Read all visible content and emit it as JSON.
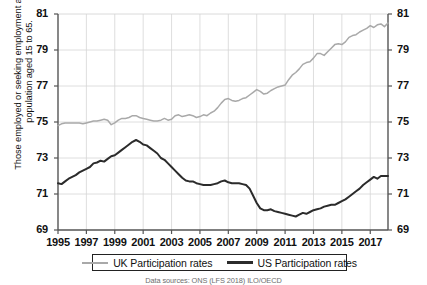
{
  "axis": {
    "y_title": "Those employed or seeking employment as % of population aged 15 to 65.",
    "y_ticks": [
      "69",
      "71",
      "73",
      "75",
      "77",
      "79",
      "81"
    ],
    "x_ticks": [
      "1995",
      "1997",
      "1999",
      "2001",
      "2003",
      "2005",
      "2007",
      "2009",
      "2011",
      "2013",
      "2015",
      "2017"
    ]
  },
  "legend": {
    "uk_label": "UK Participation rates",
    "us_label": "US Participation rates"
  },
  "source": {
    "text": "Data sources: ONS (LFS 2018) ILO/OECD"
  },
  "colors": {
    "uk_line": "#a9a9a9",
    "us_line": "#2b2b2b",
    "gridline": "#d6d6d6",
    "axis": "#555555",
    "background": "#ffffff"
  },
  "chart_data": {
    "type": "line",
    "title": "",
    "xlabel": "",
    "ylabel": "Those employed or seeking employment as % of population aged 15 to 65.",
    "xlim": [
      1995,
      2018.25
    ],
    "ylim": [
      69,
      81
    ],
    "ytick_values": [
      69,
      71,
      73,
      75,
      77,
      79,
      81
    ],
    "xtick_values": [
      1995,
      1997,
      1999,
      2001,
      2003,
      2005,
      2007,
      2009,
      2011,
      2013,
      2015,
      2017
    ],
    "grid": true,
    "legend_position": "bottom",
    "dual_y_axis": true,
    "series": [
      {
        "name": "UK Participation rates",
        "color": "#a9a9a9",
        "x": [
          1995.0,
          1995.25,
          1995.5,
          1995.75,
          1996.0,
          1996.25,
          1996.5,
          1996.75,
          1997.0,
          1997.25,
          1997.5,
          1997.75,
          1998.0,
          1998.25,
          1998.5,
          1998.75,
          1999.0,
          1999.25,
          1999.5,
          1999.75,
          2000.0,
          2000.25,
          2000.5,
          2000.75,
          2001.0,
          2001.25,
          2001.5,
          2001.75,
          2002.0,
          2002.25,
          2002.5,
          2002.75,
          2003.0,
          2003.25,
          2003.5,
          2003.75,
          2004.0,
          2004.25,
          2004.5,
          2004.75,
          2005.0,
          2005.25,
          2005.5,
          2005.75,
          2006.0,
          2006.25,
          2006.5,
          2006.75,
          2007.0,
          2007.25,
          2007.5,
          2007.75,
          2008.0,
          2008.25,
          2008.5,
          2008.75,
          2009.0,
          2009.25,
          2009.5,
          2009.75,
          2010.0,
          2010.25,
          2010.5,
          2010.75,
          2011.0,
          2011.25,
          2011.5,
          2011.75,
          2012.0,
          2012.25,
          2012.5,
          2012.75,
          2013.0,
          2013.25,
          2013.5,
          2013.75,
          2014.0,
          2014.25,
          2014.5,
          2014.75,
          2015.0,
          2015.25,
          2015.5,
          2015.75,
          2016.0,
          2016.25,
          2016.5,
          2016.75,
          2017.0,
          2017.25,
          2017.5,
          2017.75,
          2018.0,
          2018.25
        ],
        "values": [
          74.8,
          74.9,
          74.95,
          74.95,
          74.95,
          74.95,
          74.95,
          74.9,
          74.95,
          75.0,
          75.05,
          75.05,
          75.1,
          75.15,
          75.1,
          74.85,
          74.95,
          75.1,
          75.2,
          75.2,
          75.25,
          75.35,
          75.35,
          75.25,
          75.2,
          75.15,
          75.1,
          75.05,
          75.05,
          75.1,
          75.2,
          75.1,
          75.15,
          75.35,
          75.4,
          75.3,
          75.35,
          75.4,
          75.35,
          75.25,
          75.3,
          75.4,
          75.35,
          75.5,
          75.6,
          75.8,
          76.05,
          76.25,
          76.3,
          76.2,
          76.15,
          76.2,
          76.3,
          76.35,
          76.5,
          76.65,
          76.8,
          76.7,
          76.55,
          76.6,
          76.75,
          76.85,
          76.95,
          77.0,
          77.05,
          77.35,
          77.6,
          77.75,
          77.95,
          78.2,
          78.3,
          78.35,
          78.55,
          78.8,
          78.8,
          78.7,
          78.9,
          79.1,
          79.3,
          79.35,
          79.3,
          79.45,
          79.7,
          79.8,
          79.85,
          80.0,
          80.1,
          80.2,
          80.35,
          80.25,
          80.4,
          80.45,
          80.3,
          80.5
        ]
      },
      {
        "name": "US Participation rates",
        "color": "#2b2b2b",
        "x": [
          1995.0,
          1995.25,
          1995.5,
          1995.75,
          1996.0,
          1996.25,
          1996.5,
          1996.75,
          1997.0,
          1997.25,
          1997.5,
          1997.75,
          1998.0,
          1998.25,
          1998.5,
          1998.75,
          1999.0,
          1999.25,
          1999.5,
          1999.75,
          2000.0,
          2000.25,
          2000.5,
          2000.75,
          2001.0,
          2001.25,
          2001.5,
          2001.75,
          2002.0,
          2002.25,
          2002.5,
          2002.75,
          2003.0,
          2003.25,
          2003.5,
          2003.75,
          2004.0,
          2004.25,
          2004.5,
          2004.75,
          2005.0,
          2005.25,
          2005.5,
          2005.75,
          2006.0,
          2006.25,
          2006.5,
          2006.75,
          2007.0,
          2007.25,
          2007.5,
          2007.75,
          2008.0,
          2008.25,
          2008.5,
          2008.75,
          2009.0,
          2009.25,
          2009.5,
          2009.75,
          2010.0,
          2010.25,
          2010.5,
          2010.75,
          2011.0,
          2011.25,
          2011.5,
          2011.75,
          2012.0,
          2012.25,
          2012.5,
          2012.75,
          2013.0,
          2013.25,
          2013.5,
          2013.75,
          2014.0,
          2014.25,
          2014.5,
          2014.75,
          2015.0,
          2015.25,
          2015.5,
          2015.75,
          2016.0,
          2016.25,
          2016.5,
          2016.75,
          2017.0,
          2017.25,
          2017.5,
          2017.75,
          2018.0,
          2018.25
        ],
        "values": [
          71.6,
          71.55,
          71.7,
          71.85,
          71.95,
          72.05,
          72.2,
          72.3,
          72.4,
          72.5,
          72.7,
          72.75,
          72.85,
          72.8,
          72.95,
          73.1,
          73.15,
          73.3,
          73.45,
          73.6,
          73.75,
          73.9,
          74.0,
          73.9,
          73.75,
          73.7,
          73.55,
          73.4,
          73.25,
          73.0,
          72.9,
          72.7,
          72.5,
          72.3,
          72.1,
          71.9,
          71.75,
          71.7,
          71.7,
          71.6,
          71.55,
          71.5,
          71.5,
          71.5,
          71.55,
          71.6,
          71.7,
          71.75,
          71.65,
          71.6,
          71.6,
          71.6,
          71.55,
          71.5,
          71.3,
          70.9,
          70.5,
          70.2,
          70.1,
          70.1,
          70.15,
          70.05,
          70.0,
          69.95,
          69.9,
          69.85,
          69.8,
          69.75,
          69.85,
          69.95,
          69.9,
          70.0,
          70.1,
          70.15,
          70.2,
          70.3,
          70.35,
          70.4,
          70.4,
          70.5,
          70.6,
          70.7,
          70.85,
          71.0,
          71.15,
          71.3,
          71.5,
          71.65,
          71.8,
          71.95,
          71.85,
          72.0,
          72.0,
          72.0
        ]
      }
    ]
  }
}
